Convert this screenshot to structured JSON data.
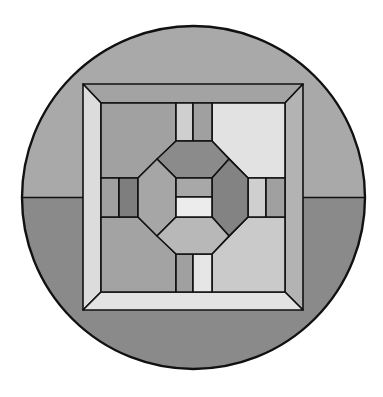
{
  "image": {
    "width": 383,
    "height": 397,
    "background": "#ffffff",
    "description": "Stained glass window design: square framed panel with octagon center inside a circle split by a horizon"
  },
  "colors": {
    "outline": "#111111",
    "sky": "#a9a9a9",
    "ground": "#8a8a8a",
    "frame_top": "#a3a3a3",
    "frame_left": "#dcdcdc",
    "frame_right": "#b3b3b3",
    "frame_bottom": "#e3e3e3",
    "panel_top_left": "#a1a1a1",
    "panel_top_right": "#e2e2e2",
    "panel_bottom_left": "#a3a3a3",
    "panel_bottom_right": "#cacaca",
    "octagon_top": "#8b8b8b",
    "octagon_left": "#a6a6a6",
    "octagon_right": "#838383",
    "octagon_bottom": "#b8b8b8",
    "center_upper": "#a8a8a8",
    "center_lower": "#ececec",
    "bar_light": "#cfcfcf",
    "bar_mid": "#a0a0a0",
    "bar_dark": "#7e7e7e",
    "bar_white": "#e6e6e6"
  }
}
